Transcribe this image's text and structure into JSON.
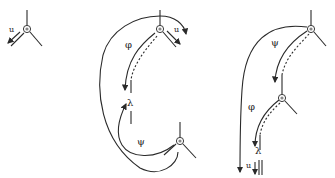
{
  "diagram": {
    "panels": [
      {
        "id": "left",
        "labels": {
          "u": "u"
        }
      },
      {
        "id": "middle",
        "labels": {
          "u": "u",
          "phi": "φ",
          "lambda": "λ",
          "psi": "ψ"
        }
      },
      {
        "id": "right",
        "labels": {
          "psi": "ψ",
          "phi": "φ",
          "lambda": "λ",
          "u": "u"
        }
      }
    ],
    "colors": {
      "stroke": "#2a2a2a",
      "background": "#ffffff",
      "node_fill": "#888888"
    }
  }
}
